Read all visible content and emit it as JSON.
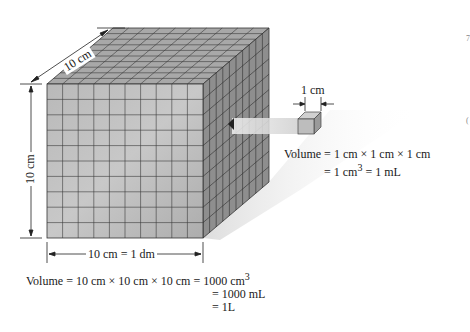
{
  "figure": {
    "large_cube": {
      "depth_label": "10 cm",
      "height_label": "10 cm",
      "width_label": "10 cm = 1 dm",
      "grid_divisions": 10
    },
    "small_cube": {
      "size_label": "1 cm"
    },
    "large_volume": {
      "line1_lhs": "Volume",
      "line1_expr": "= 10 cm × 10 cm × 10 cm =",
      "line1_result": "1000 cm",
      "line1_exp": "3",
      "line2": "= 1000 mL",
      "line3": "= 1L"
    },
    "small_volume": {
      "line1": "Volume = 1 cm × 1 cm × 1 cm",
      "line2_pre": "= 1 cm",
      "line2_exp": "3",
      "line2_post": " = 1 mL"
    },
    "margin_marks": [
      "7",
      "("
    ],
    "colors": {
      "front_face": "#b8b8b8",
      "top_face": "#a9a9a9",
      "side_face": "#8f8f8f",
      "grid_line": "#3a3a3a",
      "shadow": "#e6e6e6"
    }
  }
}
